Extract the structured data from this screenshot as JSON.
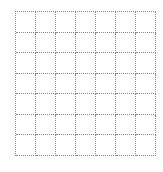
{
  "grid": {
    "rows": 7,
    "columns": 7,
    "line_color": "#8a8a8a",
    "line_style": "dotted",
    "cells": [
      [
        "",
        "",
        "",
        "",
        "",
        "",
        ""
      ],
      [
        "",
        "",
        "",
        "",
        "",
        "",
        ""
      ],
      [
        "",
        "",
        "",
        "",
        "",
        "",
        ""
      ],
      [
        "",
        "",
        "",
        "",
        "",
        "",
        ""
      ],
      [
        "",
        "",
        "",
        "",
        "",
        "",
        ""
      ],
      [
        "",
        "",
        "",
        "",
        "",
        "",
        ""
      ],
      [
        "",
        "",
        "",
        "",
        "",
        "",
        ""
      ]
    ]
  }
}
